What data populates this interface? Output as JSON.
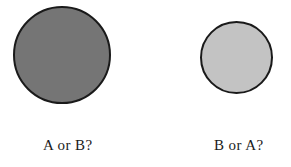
{
  "figure": {
    "background_color": "#ffffff",
    "stimuli": [
      {
        "id": "left",
        "shape_name": "circle",
        "fill_color": "#757575",
        "outline_color": "#1a1a1a",
        "shade": "dark gray",
        "diameter_px": 98,
        "caption": "A or B?"
      },
      {
        "id": "right",
        "shape_name": "circle",
        "fill_color": "#c3c3c3",
        "outline_color": "#1a1a1a",
        "shade": "light gray",
        "diameter_px": 73,
        "caption": "B or A?"
      }
    ]
  }
}
